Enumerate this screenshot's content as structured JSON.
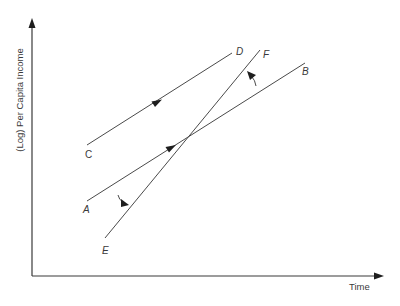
{
  "diagram": {
    "axes": {
      "y_label": "(Log) Per Capita Income",
      "x_label": "Time"
    },
    "curves": [
      {
        "id": "CD",
        "start_label": "C",
        "end_label": "D"
      },
      {
        "id": "AB",
        "start_label": "A",
        "end_label": "B"
      },
      {
        "id": "EF",
        "start_label": "E",
        "end_label": "F"
      }
    ],
    "colors": {
      "line": "#4a4a4a",
      "text": "#3a3a3a",
      "background": "#ffffff"
    }
  }
}
